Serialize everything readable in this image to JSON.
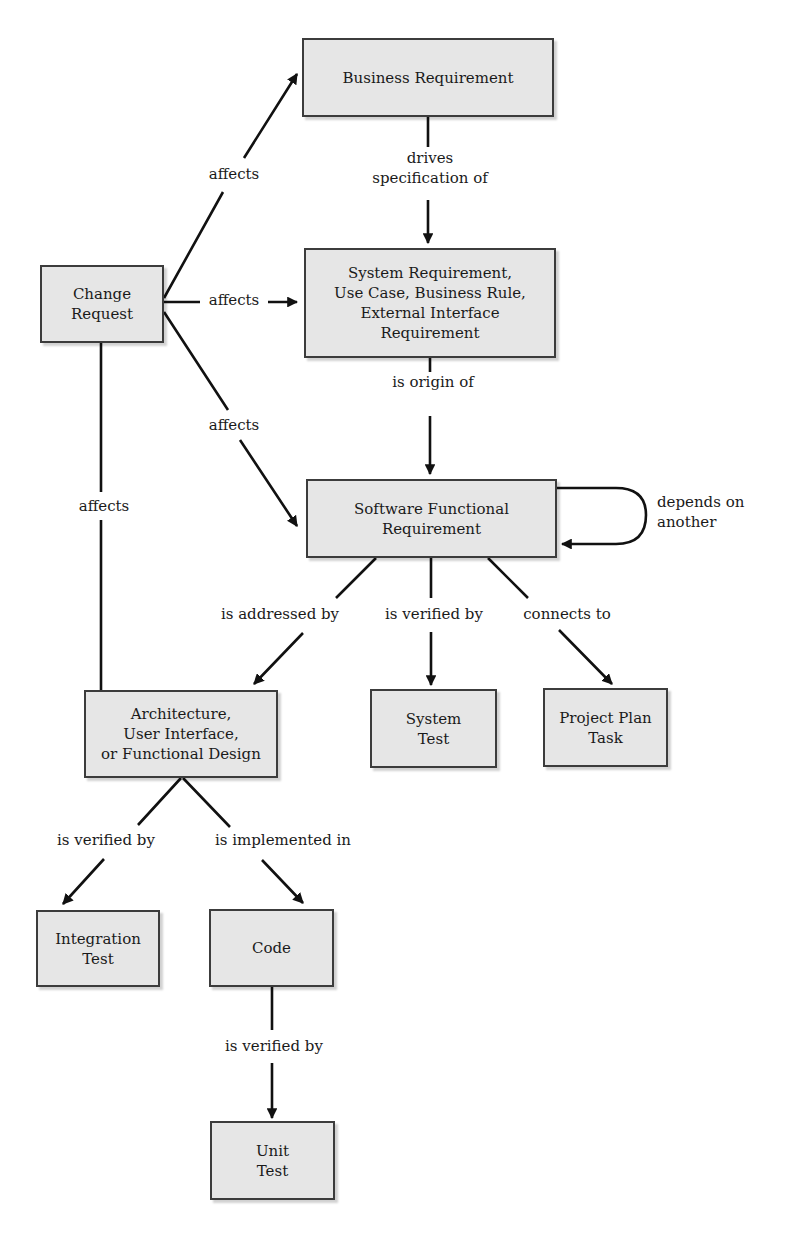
{
  "diagram": {
    "type": "requirements-traceability-flow",
    "colors": {
      "node_fill": "#e6e6e6",
      "node_border": "#3c3c3c",
      "edge": "#111111",
      "background": "#ffffff"
    },
    "nodes": [
      {
        "id": "business_requirement",
        "label": "Business Requirement"
      },
      {
        "id": "change_request",
        "label": "Change\nRequest"
      },
      {
        "id": "system_requirement",
        "label": "System Requirement,\nUse Case, Business Rule,\nExternal Interface\nRequirement"
      },
      {
        "id": "software_functional_requirement",
        "label": "Software Functional\nRequirement"
      },
      {
        "id": "design",
        "label": "Architecture,\nUser Interface,\nor Functional Design"
      },
      {
        "id": "system_test",
        "label": "System\nTest"
      },
      {
        "id": "project_plan_task",
        "label": "Project Plan\nTask"
      },
      {
        "id": "integration_test",
        "label": "Integration\nTest"
      },
      {
        "id": "code",
        "label": "Code"
      },
      {
        "id": "unit_test",
        "label": "Unit\nTest"
      }
    ],
    "edges": [
      {
        "from": "change_request",
        "to": "business_requirement",
        "label": "affects"
      },
      {
        "from": "change_request",
        "to": "system_requirement",
        "label": "affects"
      },
      {
        "from": "change_request",
        "to": "software_functional_requirement",
        "label": "affects"
      },
      {
        "from": "change_request",
        "to": "design",
        "label": "affects"
      },
      {
        "from": "business_requirement",
        "to": "system_requirement",
        "label": "drives\nspecification of"
      },
      {
        "from": "system_requirement",
        "to": "software_functional_requirement",
        "label": "is origin of"
      },
      {
        "from": "software_functional_requirement",
        "to": "software_functional_requirement",
        "label": "depends on\nanother"
      },
      {
        "from": "software_functional_requirement",
        "to": "design",
        "label": "is addressed by"
      },
      {
        "from": "software_functional_requirement",
        "to": "system_test",
        "label": "is verified by"
      },
      {
        "from": "software_functional_requirement",
        "to": "project_plan_task",
        "label": "connects to"
      },
      {
        "from": "design",
        "to": "integration_test",
        "label": "is verified by"
      },
      {
        "from": "design",
        "to": "code",
        "label": "is implemented in"
      },
      {
        "from": "code",
        "to": "unit_test",
        "label": "is verified by"
      }
    ]
  }
}
